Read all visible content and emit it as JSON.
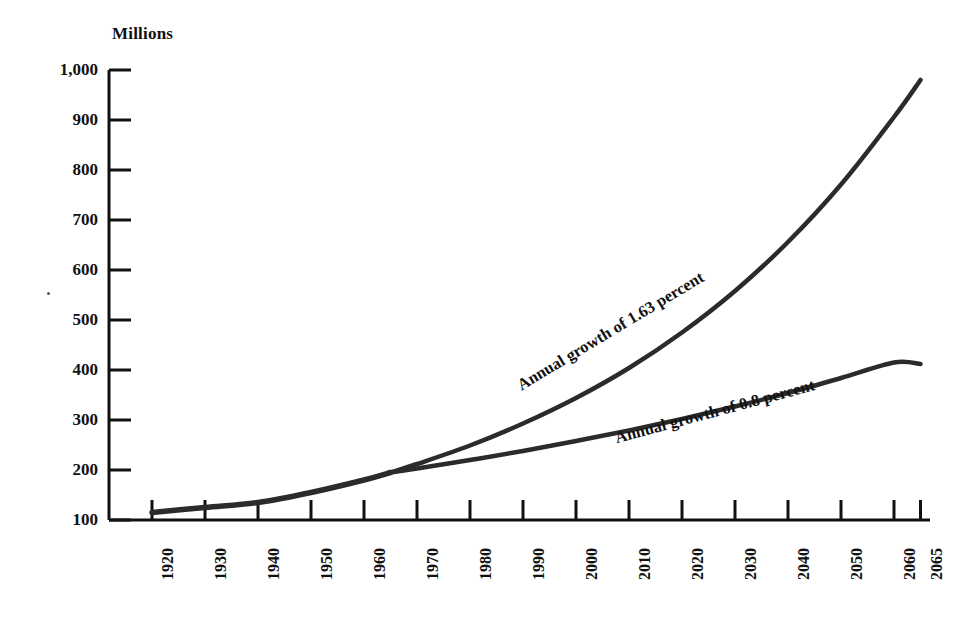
{
  "chart_data": {
    "type": "line",
    "title": "",
    "ylabel": "Millions",
    "xlabel": "",
    "ylim": [
      100,
      1000
    ],
    "ytick_labels": [
      "100",
      "200",
      "300",
      "400",
      "500",
      "600",
      "700",
      "800",
      "900",
      "1,000"
    ],
    "ytick_values": [
      100,
      200,
      300,
      400,
      500,
      600,
      700,
      800,
      900,
      1000
    ],
    "xtick_labels": [
      "1920",
      "1930",
      "1940",
      "1950",
      "1960",
      "1970",
      "1980",
      "1990",
      "2000",
      "2010",
      "2020",
      "2030",
      "2040",
      "2050",
      "2060",
      "2065"
    ],
    "xtick_values": [
      1920,
      1930,
      1940,
      1950,
      1960,
      1970,
      1980,
      1990,
      2000,
      2010,
      2020,
      2030,
      2040,
      2050,
      2060,
      2065
    ],
    "xlim": [
      1920,
      2065
    ],
    "grid": false,
    "legend_position": "inline-curve-labels",
    "line_color": "#2b2b2b",
    "series": [
      {
        "name": "Historical",
        "label": "",
        "x": [
          1920,
          1930,
          1940,
          1950,
          1960,
          1965
        ],
        "values": [
          115,
          125,
          135,
          155,
          180,
          195
        ]
      },
      {
        "name": "Annual growth of 1.63 percent",
        "label": "Annual growth of 1.63 percent",
        "x": [
          1965,
          1970,
          1980,
          1990,
          2000,
          2010,
          2020,
          2030,
          2040,
          2050,
          2060,
          2065
        ],
        "values": [
          195,
          212,
          249,
          293,
          344,
          404,
          475,
          558,
          656,
          771,
          906,
          980
        ]
      },
      {
        "name": "Annual growth of 0.8 percent",
        "label": "Annual growth of 0.8 percent",
        "x": [
          1965,
          1970,
          1980,
          1990,
          2000,
          2010,
          2020,
          2030,
          2040,
          2050,
          2060,
          2065
        ],
        "values": [
          195,
          203,
          220,
          238,
          258,
          279,
          302,
          327,
          354,
          384,
          415,
          412
        ]
      }
    ],
    "annotations": [
      {
        "text": "Annual growth of 1.63 percent",
        "series": "Annual growth of 1.63 percent"
      },
      {
        "text": "Annual growth of 0.8 percent",
        "series": "Annual growth of 0.8 percent"
      }
    ]
  }
}
